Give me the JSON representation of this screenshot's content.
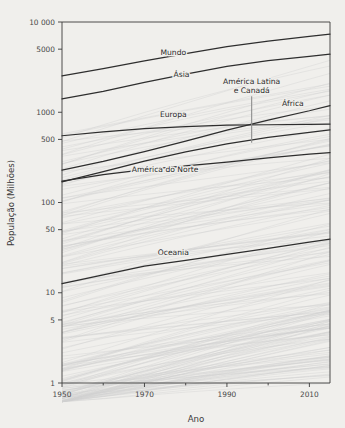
{
  "chart_data": {
    "type": "line",
    "title": "",
    "xlabel": "Ano",
    "ylabel": "População (Milhões)",
    "yscale": "log",
    "xlim": [
      1950,
      2015
    ],
    "ylim": [
      1,
      10000
    ],
    "grid": false,
    "legend": "inline-labels",
    "xticks": [
      1950,
      1970,
      1990,
      2010
    ],
    "xtick_labels": [
      "1950",
      "1970",
      "1990",
      "2010"
    ],
    "xminor_ticks": [
      1960,
      1980,
      2000
    ],
    "yticks": [
      1,
      5,
      10,
      50,
      100,
      500,
      1000,
      5000,
      10000
    ],
    "ytick_labels": [
      "1",
      "5",
      "10",
      "50",
      "100",
      "500",
      "1000",
      "5000",
      "10 000"
    ],
    "x": [
      1950,
      1960,
      1970,
      1980,
      1990,
      2000,
      2010,
      2015
    ],
    "series": [
      {
        "name": "Mundo",
        "label": "Mundo",
        "highlighted": true,
        "color": "#2e2e2e",
        "label_x": 1977,
        "label_y": 4300,
        "values": [
          2536,
          3035,
          3700,
          4458,
          5327,
          6145,
          6930,
          7350
        ]
      },
      {
        "name": "Ásia",
        "label": "Ásia",
        "highlighted": true,
        "color": "#2e2e2e",
        "label_x": 1979,
        "label_y": 2450,
        "values": [
          1404,
          1700,
          2144,
          2642,
          3226,
          3741,
          4165,
          4393
        ]
      },
      {
        "name": "África",
        "label": "África",
        "highlighted": true,
        "color": "#2e2e2e",
        "label_x": 2006,
        "label_y": 1160,
        "values": [
          229,
          285,
          366,
          478,
          633,
          818,
          1039,
          1186
        ]
      },
      {
        "name": "Europa",
        "label": "Europa",
        "highlighted": true,
        "color": "#2e2e2e",
        "label_x": 1977,
        "label_y": 880,
        "values": [
          549,
          605,
          657,
          694,
          721,
          727,
          736,
          740
        ]
      },
      {
        "name": "América Latina e Canadá",
        "label": "América Latina\ne Canadá",
        "highlighted": true,
        "color": "#2e2e2e",
        "label_x": 1996,
        "label_y": 2050,
        "leader_from_y": 1500,
        "leader_to_y": 460,
        "leader_x": 1996,
        "values": [
          169,
          220,
          288,
          364,
          446,
          527,
          600,
          637
        ]
      },
      {
        "name": "América do Norte",
        "label": "América do Norte",
        "highlighted": true,
        "color": "#2e2e2e",
        "label_x": 1975,
        "label_y": 215,
        "values": [
          172,
          204,
          231,
          254,
          280,
          313,
          344,
          358
        ]
      },
      {
        "name": "Oceania",
        "label": "Oceania",
        "highlighted": true,
        "color": "#2e2e2e",
        "label_x": 1977,
        "label_y": 26,
        "values": [
          12.6,
          15.8,
          19.7,
          22.9,
          26.7,
          31.0,
          36.4,
          39.3
        ]
      }
    ],
    "background_series_note": "approximately 200 faint gray individual country population trajectories",
    "background_series_count": 200
  },
  "axes": {
    "y_title": "População (Milhões)",
    "x_title": "Ano"
  }
}
